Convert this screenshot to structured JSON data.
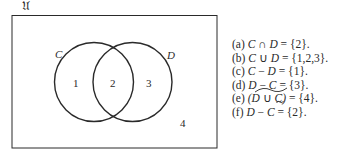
{
  "diagram": {
    "universe_label": "𝔘",
    "set_labels": {
      "left": "C",
      "right": "D"
    },
    "region_labels": [
      "1",
      "2",
      "3",
      "4"
    ],
    "colors": {
      "stroke": "#2a2a2a",
      "background": "#ffffff"
    }
  },
  "answers": [
    {
      "tag": "(a)",
      "lhs_a": "C",
      "op": " ∩ ",
      "lhs_b": "D",
      "rhs": " = {2}."
    },
    {
      "tag": "(b)",
      "lhs_a": "C",
      "op": " ∪ ",
      "lhs_b": "D",
      "rhs": " = {1,2,3}."
    },
    {
      "tag": "(c)",
      "lhs_a": "C",
      "op": " − ",
      "lhs_b": "D",
      "rhs": " = {1}."
    },
    {
      "tag": "(d)",
      "lhs_a": "D",
      "op": " − ",
      "lhs_b": "C",
      "rhs": " = {3}."
    },
    {
      "tag": "(e)",
      "lhs_a": "(D",
      "op": " ∪ ",
      "lhs_b": "C)",
      "rhs": " = {4}."
    },
    {
      "tag": "(f)",
      "lhs_a": "D",
      "op": " − ",
      "lhs_b": "C",
      "rhs": " = {2}."
    }
  ]
}
